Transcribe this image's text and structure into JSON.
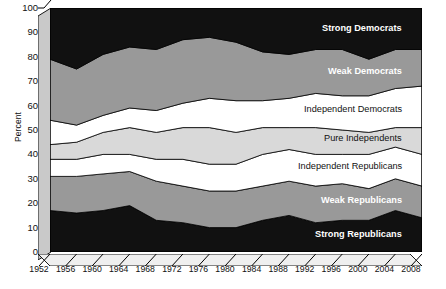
{
  "axes": {
    "ylabel": "Percent",
    "yticks": [
      "0",
      "10",
      "20",
      "30",
      "40",
      "50",
      "60",
      "70",
      "80",
      "90",
      "100"
    ],
    "xticks": [
      "1952",
      "1956",
      "1960",
      "1964",
      "1968",
      "1972",
      "1976",
      "1980",
      "1984",
      "1988",
      "1992",
      "1996",
      "2000",
      "2004",
      "2008"
    ]
  },
  "band_labels": [
    {
      "text": "Strong Democrats",
      "style": "bold"
    },
    {
      "text": "Weak Democrats",
      "style": "bold"
    },
    {
      "text": "Independent Democrats",
      "style": "plain"
    },
    {
      "text": "Pure Independents",
      "style": "plain"
    },
    {
      "text": "Independent Republicans",
      "style": "plain"
    },
    {
      "text": "Weak Republicans",
      "style": "bold"
    },
    {
      "text": "Strong Republicans",
      "style": "bold"
    }
  ],
  "colors": {
    "strong_democrats": "#111111",
    "weak_democrats": "#999999",
    "independent_democrats": "#ffffff",
    "pure_independents": "#d9d9d9",
    "independent_republicans": "#ffffff",
    "weak_republicans": "#999999",
    "strong_republicans": "#111111",
    "slab_face": "#c9c9c9",
    "slab_top": "#e4e4e4",
    "axis": "#000000"
  },
  "chart_data": {
    "type": "area",
    "title": "",
    "xlabel": "",
    "ylabel": "Percent",
    "ylim": [
      0,
      100
    ],
    "grid": false,
    "legend": "inline-band-labels",
    "x": [
      1952,
      1956,
      1960,
      1964,
      1968,
      1972,
      1976,
      1980,
      1984,
      1988,
      1992,
      1996,
      2000,
      2004,
      2008
    ],
    "series": [
      {
        "name": "Strong Republicans",
        "values": [
          17,
          16,
          17,
          19,
          13,
          12,
          10,
          10,
          13,
          15,
          12,
          13,
          13,
          17,
          14
        ]
      },
      {
        "name": "Weak Republicans",
        "values": [
          14,
          15,
          15,
          14,
          16,
          15,
          15,
          15,
          14,
          14,
          15,
          15,
          13,
          13,
          13
        ]
      },
      {
        "name": "Independent Republicans",
        "values": [
          7,
          7,
          8,
          7,
          9,
          11,
          11,
          11,
          13,
          13,
          13,
          12,
          14,
          13,
          13
        ]
      },
      {
        "name": "Pure Independents",
        "values": [
          6,
          7,
          9,
          11,
          11,
          13,
          15,
          13,
          11,
          9,
          11,
          10,
          9,
          8,
          11
        ]
      },
      {
        "name": "Independent Democrats",
        "values": [
          10,
          7,
          7,
          8,
          9,
          10,
          12,
          13,
          11,
          12,
          14,
          14,
          15,
          16,
          17
        ]
      },
      {
        "name": "Weak Democrats",
        "values": [
          25,
          23,
          25,
          25,
          25,
          26,
          25,
          24,
          20,
          18,
          18,
          19,
          15,
          16,
          15
        ]
      },
      {
        "name": "Strong Democrats",
        "values": [
          21,
          25,
          19,
          16,
          17,
          13,
          12,
          14,
          18,
          19,
          17,
          17,
          21,
          17,
          17
        ]
      }
    ],
    "stack_order_bottom_to_top": [
      "Strong Republicans",
      "Weak Republicans",
      "Independent Republicans",
      "Pure Independents",
      "Independent Democrats",
      "Weak Democrats",
      "Strong Democrats"
    ],
    "stacked_to_100": true
  }
}
